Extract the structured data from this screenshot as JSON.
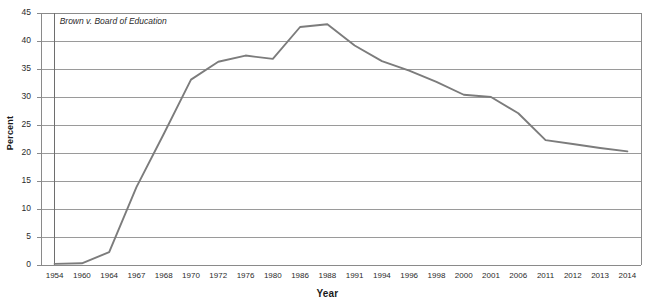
{
  "chart_data": {
    "type": "line",
    "title": "",
    "xlabel": "Year",
    "ylabel": "Percent",
    "ylim": [
      0,
      45
    ],
    "ytick_step": 5,
    "grid": true,
    "legend": null,
    "categories": [
      "1954",
      "1960",
      "1964",
      "1967",
      "1968",
      "1970",
      "1972",
      "1976",
      "1980",
      "1986",
      "1988",
      "1991",
      "1994",
      "1996",
      "1998",
      "2000",
      "2001",
      "2006",
      "2011",
      "2012",
      "2013",
      "2014"
    ],
    "yticks": [
      "0",
      "5",
      "10",
      "15",
      "20",
      "25",
      "30",
      "35",
      "40",
      "45"
    ],
    "series": [
      {
        "name": "Percent",
        "color": "#7c7c7c",
        "values": [
          0.2,
          0.3,
          2.3,
          13.9,
          23.4,
          33.1,
          36.3,
          37.4,
          36.8,
          42.5,
          43.0,
          39.2,
          36.4,
          34.7,
          32.7,
          30.4,
          30.0,
          27.1,
          22.3,
          21.6,
          20.9,
          20.3
        ]
      }
    ],
    "annotations": [
      {
        "name": "brown-v-board",
        "text": "Brown v. Board of Education",
        "at_category": "1954",
        "type": "vertical-line-with-label"
      }
    ],
    "axis_color": "#8a8a8a",
    "grid_color": "#9a9a9a",
    "text_color": "#2b2b2b"
  }
}
